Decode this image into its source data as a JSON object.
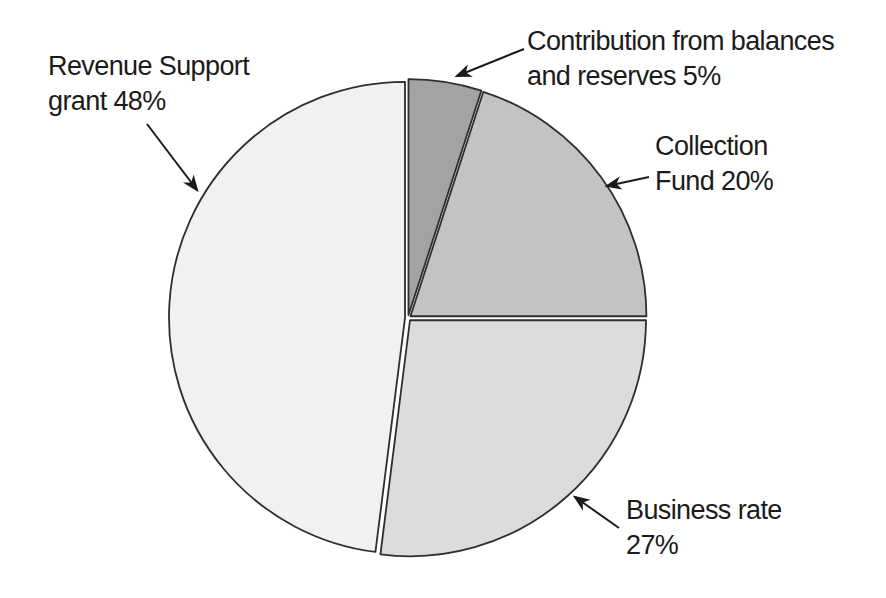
{
  "chart_data": {
    "type": "pie",
    "title": "",
    "legend": "none",
    "categories": [
      "Contribution from balances and reserves",
      "Collection Fund",
      "Business rate",
      "Revenue Support grant"
    ],
    "values": [
      5,
      20,
      27,
      48
    ],
    "slices": [
      {
        "id": "contribution-from-balances-and-reserves",
        "label": "Contribution from balances and reserves",
        "value": 5,
        "color": "#a3a3a3"
      },
      {
        "id": "collection-fund",
        "label": "Collection Fund",
        "value": 20,
        "color": "#c3c3c3"
      },
      {
        "id": "business-rate",
        "label": "Business rate",
        "value": 27,
        "color": "#dcdcdc"
      },
      {
        "id": "revenue-support-grant",
        "label": "Revenue Support grant",
        "value": 48,
        "color": "#f1f1f1"
      }
    ],
    "start_angle_deg": 0,
    "direction": "clockwise",
    "canvas": {
      "width": 886,
      "height": 598
    },
    "center": {
      "x": 408,
      "y": 318
    },
    "radius": 236,
    "explode_px": 3,
    "outline_color": "#2e2e2e",
    "outline_width": 1.8,
    "gap_color": "#ffffff",
    "text_color": "#1b1b1b",
    "annotations": [
      {
        "id": "revenue-support-grant",
        "lines": [
          "Revenue Support",
          "grant 48%"
        ],
        "text_x": 48,
        "text_y": 49,
        "arrow": {
          "x1": 147,
          "y1": 124,
          "x2": 197,
          "y2": 190
        }
      },
      {
        "id": "contribution-from-balances-and-reserves",
        "lines": [
          "Contribution from balances",
          "and reserves 5%"
        ],
        "text_x": 527,
        "text_y": 24,
        "arrow": {
          "x1": 524,
          "y1": 49,
          "x2": 457,
          "y2": 76
        }
      },
      {
        "id": "collection-fund",
        "lines": [
          "Collection",
          "Fund 20%"
        ],
        "text_x": 655,
        "text_y": 129,
        "arrow": {
          "x1": 649,
          "y1": 177,
          "x2": 607,
          "y2": 186
        }
      },
      {
        "id": "business-rate",
        "lines": [
          "Business rate",
          "27%"
        ],
        "text_x": 626,
        "text_y": 493,
        "arrow": {
          "x1": 619,
          "y1": 528,
          "x2": 575,
          "y2": 497
        }
      }
    ]
  }
}
